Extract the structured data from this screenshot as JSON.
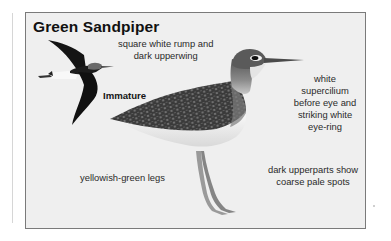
{
  "figure": {
    "title": "Green Sandpiper",
    "colors": {
      "panel_background": "#efefef",
      "panel_border": "#7a7a7a",
      "text": "#2a2a2a",
      "bird_dark": "#2b2b2b",
      "bird_light": "#f7f7f7",
      "legs": "#8c8c8c"
    },
    "illustrations": [
      {
        "name": "flying-immature-bird",
        "caption": "Immature"
      },
      {
        "name": "standing-adult-bird"
      }
    ],
    "annotations": {
      "flight_rump": [
        "square white rump and",
        "dark upperwing"
      ],
      "immature": "Immature",
      "supercilium": [
        "white",
        "supercilium",
        "before eye and",
        "striking white",
        "eye-ring"
      ],
      "legs": "yellowish-green legs",
      "upperparts": [
        "dark upperparts show",
        "coarse pale spots"
      ]
    }
  }
}
